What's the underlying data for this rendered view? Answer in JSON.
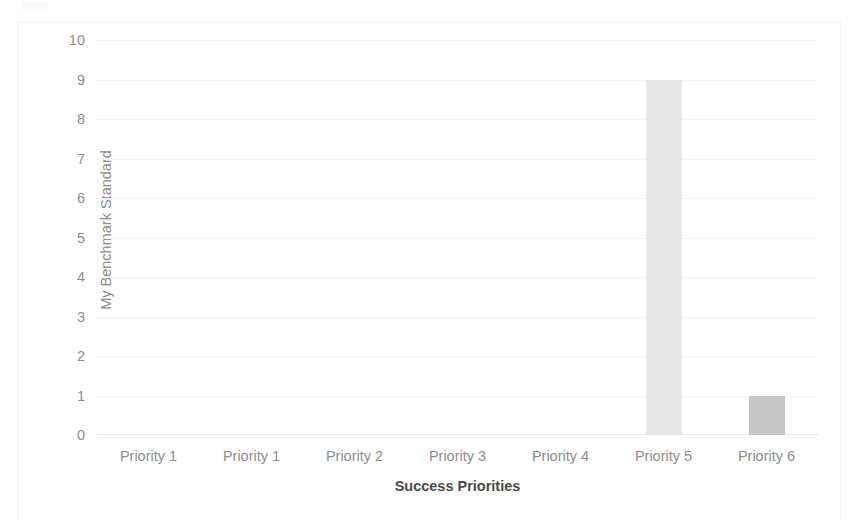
{
  "chart_data": {
    "type": "bar",
    "title": "",
    "xlabel": "Success Priorities",
    "ylabel": "My Benchmark Standard",
    "categories": [
      "Priority 1",
      "Priority 1",
      "Priority 2",
      "Priority 3",
      "Priority 4",
      "Priority 5",
      "Priority 6"
    ],
    "values": [
      0,
      0,
      0,
      0,
      0,
      9,
      1
    ],
    "series": [
      {
        "name": "My Benchmark Standard",
        "values": [
          0,
          0,
          0,
          0,
          0,
          9,
          1
        ]
      }
    ],
    "ylim": [
      0,
      10
    ],
    "yticks": [
      0,
      1,
      2,
      3,
      4,
      5,
      6,
      7,
      8,
      9,
      10
    ],
    "ytick_labels": [
      "0",
      "1",
      "2",
      "3",
      "4",
      "5",
      "6",
      "7",
      "8",
      "9",
      "10"
    ],
    "grid": true,
    "grid_axis": "y",
    "legend": false,
    "legend_position": "none",
    "bar_colors": [
      "#ededed",
      "#ededed",
      "#ededed",
      "#ededed",
      "#ededed",
      "#e8e8e8",
      "#c6c6c6"
    ],
    "annotations": []
  },
  "colors": {
    "background": "#ffffff",
    "gridline": "#f4f4f4",
    "axis_line": "#e9e9e9",
    "tick_label": "#8d8d8d",
    "axis_title": "#4a4a4a",
    "y_axis_title": "#8a8a8a",
    "bar_light": "#e8e8e8",
    "bar_dark": "#c6c6c6",
    "frame_border": "#efefef"
  }
}
